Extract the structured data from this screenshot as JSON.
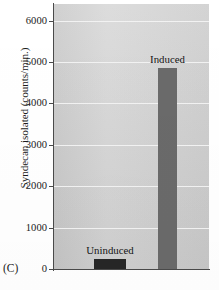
{
  "figure": {
    "panel_label": "(C)",
    "ylabel": "Syndecan isolated (counts/min.)"
  },
  "colors": {
    "plot_background": "#d6d6d6",
    "gridline": "#f2f2f2",
    "axis": "#4a4a4a",
    "uninduced_bar": "#262626",
    "induced_bar": "#6a6a6a",
    "text": "#1c1c1c",
    "page_background": "#ffffff"
  },
  "axis": {
    "y_ticks": [
      "0",
      "1000",
      "2000",
      "3000",
      "4000",
      "5000",
      "6000"
    ]
  },
  "chart_data": {
    "type": "bar",
    "title": "",
    "subtitle": "",
    "xlabel": "",
    "ylabel": "Syndecan isolated (counts/min.)",
    "categories": [
      "Uninduced",
      "Induced"
    ],
    "values": [
      250,
      4850
    ],
    "ylim": [
      0,
      6400
    ],
    "yticks": [
      0,
      1000,
      2000,
      3000,
      4000,
      5000,
      6000
    ],
    "grid": true,
    "legend": "none",
    "bar_colors": [
      "#262626",
      "#6a6a6a"
    ],
    "annotations": [
      {
        "text": "Uninduced",
        "for": "Uninduced",
        "position": "above-bar"
      },
      {
        "text": "Induced",
        "for": "Induced",
        "position": "above-bar"
      },
      {
        "text": "(C)",
        "position": "bottom-left-panel-label"
      }
    ]
  }
}
